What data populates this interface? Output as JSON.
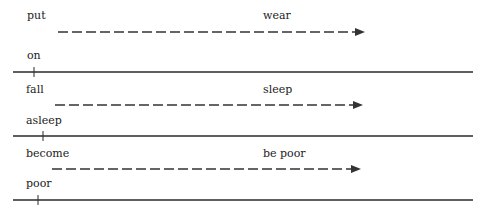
{
  "rows": [
    {
      "verb": "put",
      "meaning": "wear",
      "particle": "on",
      "colors": {
        "line": "#2a2a2a",
        "arrow": "#333333"
      }
    },
    {
      "verb": "fall",
      "meaning": "sleep",
      "particle": "asleep",
      "colors": {
        "line": "#2a2a2a",
        "arrow": "#333333"
      }
    },
    {
      "verb": "become",
      "meaning": "be poor",
      "particle": "poor",
      "colors": {
        "line": "#2a2a2a",
        "arrow": "#333333"
      }
    }
  ]
}
